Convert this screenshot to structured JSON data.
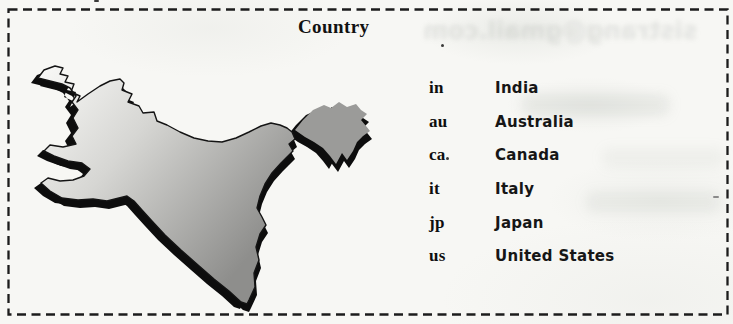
{
  "figure": {
    "title": "Country",
    "background": "#f7f7f4",
    "border_color": "#1c1c1c"
  },
  "country_table": {
    "rows": [
      {
        "code": "in",
        "name": "India"
      },
      {
        "code": "au",
        "name": "Australia"
      },
      {
        "code": "ca",
        "name": "Canada"
      },
      {
        "code": "it",
        "name": "Italy"
      },
      {
        "code": "jp",
        "name": "Japan"
      },
      {
        "code": "us",
        "name": "United States"
      }
    ]
  },
  "map": {
    "label": "india-map-shaded-relief",
    "fill_light": "#fafaf8",
    "fill_mid": "#d6d6d3",
    "fill_dark": "#8e8e8c",
    "northeast_fill": "#9b9b99",
    "shadow_color": "#0d0d0d",
    "outline_color": "#141414"
  },
  "scan_artifacts": {
    "ghost_text_top": "sistrang@gmail.com"
  }
}
